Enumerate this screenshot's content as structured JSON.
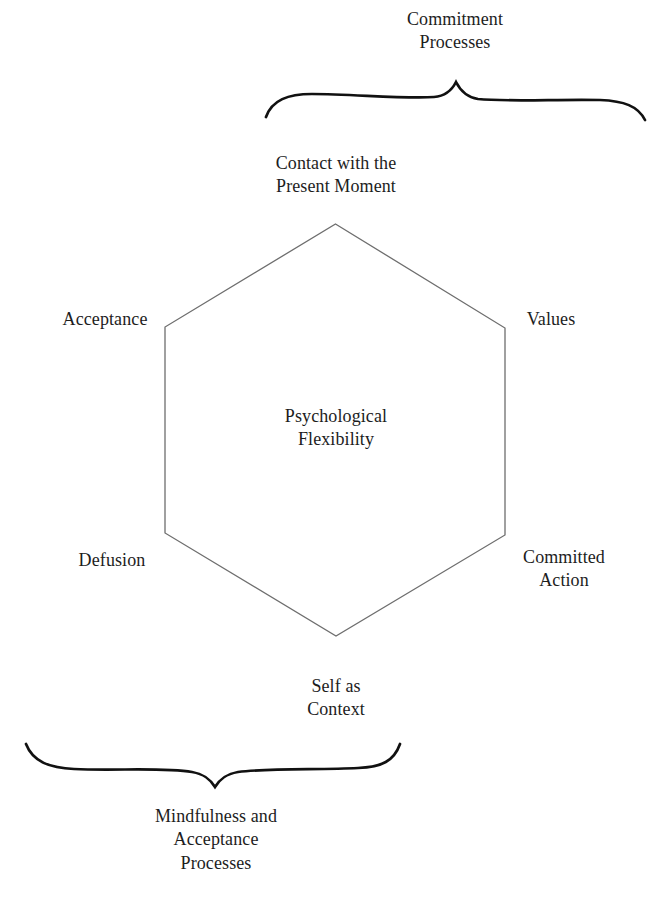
{
  "diagram": {
    "center_label": "Psychological\nFlexibility",
    "core_color": "#1d1d1d",
    "hexagon_stroke": "#6e6e6e",
    "brace_stroke": "#111111",
    "background": "#ffffff",
    "vertices": [
      {
        "id": "contact-present-moment",
        "label": "Contact with the\nPresent Moment",
        "position": "top"
      },
      {
        "id": "values",
        "label": "Values",
        "position": "upper-right"
      },
      {
        "id": "committed-action",
        "label": "Committed\nAction",
        "position": "lower-right"
      },
      {
        "id": "self-as-context",
        "label": "Self as\nContext",
        "position": "bottom"
      },
      {
        "id": "defusion",
        "label": "Defusion",
        "position": "lower-left"
      },
      {
        "id": "acceptance",
        "label": "Acceptance",
        "position": "upper-left"
      }
    ],
    "groupings": [
      {
        "id": "commitment-processes",
        "label": "Commitment\nProcesses",
        "position": "top-right",
        "brace": "up"
      },
      {
        "id": "mindfulness-acceptance-processes",
        "label": "Mindfulness and\nAcceptance\nProcesses",
        "position": "bottom-left",
        "brace": "down"
      }
    ]
  }
}
